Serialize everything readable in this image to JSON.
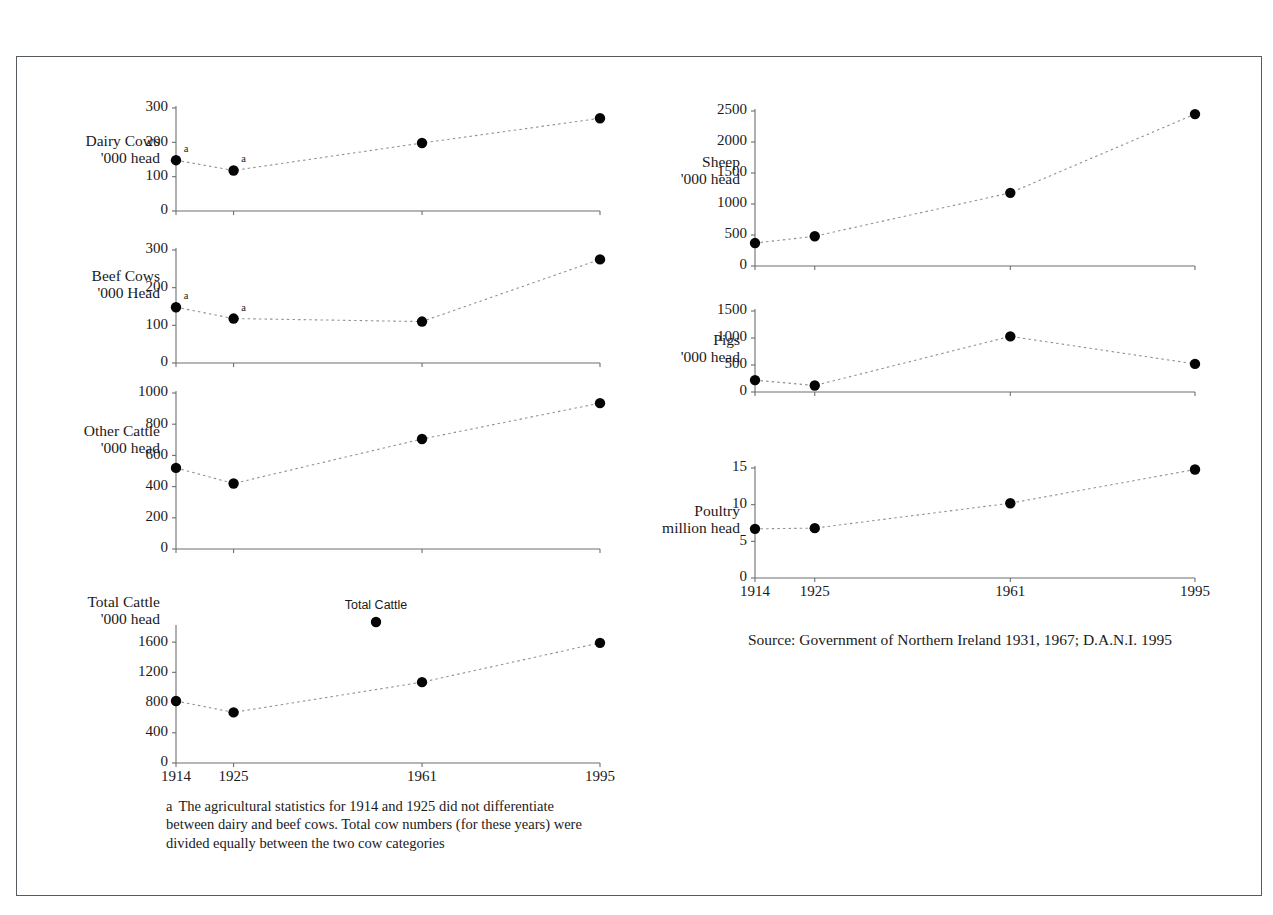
{
  "figure": {
    "source_note": "Source: Government of Northern Ireland 1931, 1967;  D.A.N.I.  1995",
    "footnote_letter": "a",
    "footnote_text": "The agricultural statistics for 1914 and 1925 did not differentiate between dairy and beef cows. Total cow numbers (for these years) were divided equally between the two cow categories",
    "legend_label": "Total Cattle"
  },
  "chart_data": [
    {
      "id": "dairy-cows",
      "type": "line",
      "title": "Dairy Cows",
      "ylabel_line1": "Dairy Cows",
      "ylabel_line2": "'000 head",
      "xlabel": "",
      "x": [
        1914,
        1925,
        1961,
        1995
      ],
      "categories": [
        "1914",
        "1925",
        "1961",
        "1995"
      ],
      "values": [
        148,
        118,
        198,
        270
      ],
      "yticks": [
        0,
        100,
        200,
        300
      ],
      "ylim": [
        0,
        300
      ],
      "xlim": [
        1914,
        1995
      ],
      "grid": false,
      "footnote_points": [
        1914,
        1925
      ],
      "show_xaxis_labels": false
    },
    {
      "id": "beef-cows",
      "type": "line",
      "title": "Beef Cows",
      "ylabel_line1": "Beef Cows",
      "ylabel_line2": "'000 Head",
      "xlabel": "",
      "x": [
        1914,
        1925,
        1961,
        1995
      ],
      "categories": [
        "1914",
        "1925",
        "1961",
        "1995"
      ],
      "values": [
        148,
        118,
        110,
        275
      ],
      "yticks": [
        0,
        100,
        200,
        300
      ],
      "ylim": [
        0,
        300
      ],
      "xlim": [
        1914,
        1995
      ],
      "grid": false,
      "footnote_points": [
        1914,
        1925
      ],
      "show_xaxis_labels": false
    },
    {
      "id": "other-cattle",
      "type": "line",
      "title": "Other Cattle",
      "ylabel_line1": "Other Cattle",
      "ylabel_line2": "'000 head",
      "xlabel": "",
      "x": [
        1914,
        1925,
        1961,
        1995
      ],
      "categories": [
        "1914",
        "1925",
        "1961",
        "1995"
      ],
      "values": [
        520,
        420,
        705,
        935
      ],
      "yticks": [
        0,
        200,
        400,
        600,
        800,
        1000
      ],
      "ylim": [
        0,
        1000
      ],
      "xlim": [
        1914,
        1995
      ],
      "grid": false,
      "footnote_points": [],
      "show_xaxis_labels": false
    },
    {
      "id": "total-cattle",
      "type": "line",
      "title": "Total Cattle",
      "ylabel_line1": "Total Cattle",
      "ylabel_line2": "'000 head",
      "xlabel": "",
      "x": [
        1914,
        1925,
        1961,
        1995
      ],
      "categories": [
        "1914",
        "1925",
        "1961",
        "1995"
      ],
      "values": [
        820,
        670,
        1070,
        1590
      ],
      "yticks": [
        0,
        400,
        800,
        1200,
        1600
      ],
      "ylim": [
        0,
        1800
      ],
      "xlim": [
        1914,
        1995
      ],
      "grid": false,
      "footnote_points": [],
      "show_xaxis_labels": true
    },
    {
      "id": "sheep",
      "type": "line",
      "title": "Sheep",
      "ylabel_line1": "Sheep",
      "ylabel_line2": "'000 head",
      "xlabel": "",
      "x": [
        1914,
        1925,
        1961,
        1995
      ],
      "categories": [
        "1914",
        "1925",
        "1961",
        "1995"
      ],
      "values": [
        370,
        480,
        1180,
        2450
      ],
      "yticks": [
        0,
        500,
        1000,
        1500,
        2000,
        2500
      ],
      "ylim": [
        0,
        2500
      ],
      "xlim": [
        1914,
        1995
      ],
      "grid": false,
      "footnote_points": [],
      "show_xaxis_labels": false
    },
    {
      "id": "pigs",
      "type": "line",
      "title": "Pigs",
      "ylabel_line1": "Pigs",
      "ylabel_line2": "'000 head",
      "xlabel": "",
      "x": [
        1914,
        1925,
        1961,
        1995
      ],
      "categories": [
        "1914",
        "1925",
        "1961",
        "1995"
      ],
      "values": [
        220,
        120,
        1030,
        520
      ],
      "yticks": [
        0,
        500,
        1000,
        1500
      ],
      "ylim": [
        0,
        1500
      ],
      "xlim": [
        1914,
        1995
      ],
      "grid": false,
      "footnote_points": [],
      "show_xaxis_labels": false
    },
    {
      "id": "poultry",
      "type": "line",
      "title": "Poultry",
      "ylabel_line1": "Poultry",
      "ylabel_line2": "million head",
      "xlabel": "",
      "x": [
        1914,
        1925,
        1961,
        1995
      ],
      "categories": [
        "1914",
        "1925",
        "1961",
        "1995"
      ],
      "values": [
        6.7,
        6.8,
        10.2,
        14.8
      ],
      "yticks": [
        0,
        5,
        10,
        15
      ],
      "ylim": [
        0,
        15
      ],
      "xlim": [
        1914,
        1995
      ],
      "grid": false,
      "footnote_points": [],
      "show_xaxis_labels": true
    }
  ],
  "layout": {
    "panels": [
      {
        "id": "dairy-cows",
        "plot_x": 176,
        "plot_right": 600,
        "plot_top": 108,
        "plot_bottom": 211,
        "label_x": 160,
        "label_y": 146
      },
      {
        "id": "beef-cows",
        "plot_x": 176,
        "plot_right": 600,
        "plot_top": 250,
        "plot_bottom": 363,
        "label_x": 160,
        "label_y": 281
      },
      {
        "id": "other-cattle",
        "plot_x": 176,
        "plot_right": 600,
        "plot_top": 393,
        "plot_bottom": 549,
        "label_x": 160,
        "label_y": 436
      },
      {
        "id": "total-cattle",
        "plot_x": 176,
        "plot_right": 600,
        "plot_top": 627,
        "plot_bottom": 763,
        "label_x": 160,
        "label_y": 607
      },
      {
        "id": "sheep",
        "plot_x": 755,
        "plot_right": 1195,
        "plot_top": 111,
        "plot_bottom": 266,
        "label_x": 740,
        "label_y": 167
      },
      {
        "id": "pigs",
        "plot_x": 755,
        "plot_right": 1195,
        "plot_top": 311,
        "plot_bottom": 392,
        "label_x": 740,
        "label_y": 345
      },
      {
        "id": "poultry",
        "plot_x": 755,
        "plot_right": 1195,
        "plot_top": 468,
        "plot_bottom": 578,
        "label_x": 740,
        "label_y": 516
      }
    ],
    "legend": {
      "x": 376,
      "label_y": 609,
      "marker_x": 376,
      "marker_y": 622
    }
  }
}
